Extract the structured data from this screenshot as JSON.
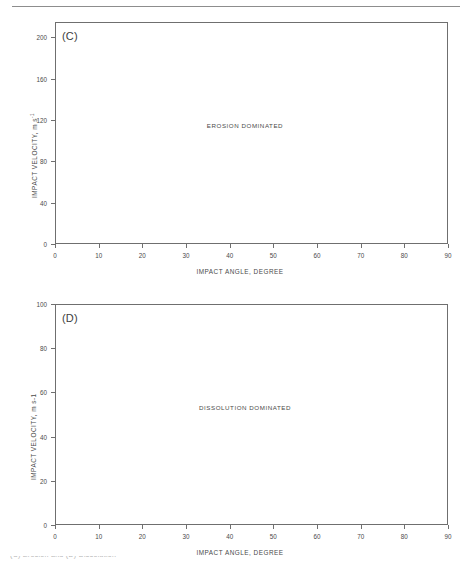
{
  "figure": {
    "background_color": "#ffffff",
    "axis_color": "#6f6f6f",
    "text_color": "#4a4a4a",
    "rule_color": "#8d8d8d",
    "footer_partial_text": "(C) Erosion and (D) Dissolution"
  },
  "chart_data": [
    {
      "type": "scatter",
      "panel_letter": "(C)",
      "title": "",
      "annotation": "EROSION DOMINATED",
      "xlabel": "IMPACT ANGLE, DEGREE",
      "ylabel": "IMPACT VELOCITY, m s",
      "ylabel_superscript": "-1",
      "xlim": [
        0,
        90
      ],
      "ylim": [
        0,
        215
      ],
      "xticks": [
        0,
        10,
        20,
        30,
        40,
        50,
        60,
        70,
        80,
        90
      ],
      "yticks": [
        0,
        40,
        80,
        120,
        160,
        200
      ],
      "xticklabels": [
        "0",
        "10",
        "20",
        "30",
        "40",
        "50",
        "60",
        "70",
        "80",
        "90"
      ],
      "yticklabels": [
        "0",
        "40",
        "80",
        "120",
        "160",
        "200"
      ],
      "grid": false,
      "legend": "none",
      "series": [
        {
          "name": "erosion-region",
          "x": [],
          "y": []
        }
      ]
    },
    {
      "type": "scatter",
      "panel_letter": "(D)",
      "title": "",
      "annotation": "DISSOLUTION DOMINATED",
      "xlabel": "IMPACT ANGLE, DEGREE",
      "ylabel": "IMPACT VELOCITY, m s-1",
      "ylabel_superscript": "",
      "xlim": [
        0,
        90
      ],
      "ylim": [
        0,
        100
      ],
      "xticks": [
        0,
        10,
        20,
        30,
        40,
        50,
        60,
        70,
        80,
        90
      ],
      "yticks": [
        0,
        20,
        40,
        60,
        80,
        100
      ],
      "xticklabels": [
        "0",
        "10",
        "20",
        "30",
        "40",
        "50",
        "60",
        "70",
        "80",
        "90"
      ],
      "yticklabels": [
        "0",
        "20",
        "40",
        "60",
        "80",
        "100"
      ],
      "grid": false,
      "legend": "none",
      "series": [
        {
          "name": "dissolution-region",
          "x": [],
          "y": []
        }
      ]
    }
  ]
}
